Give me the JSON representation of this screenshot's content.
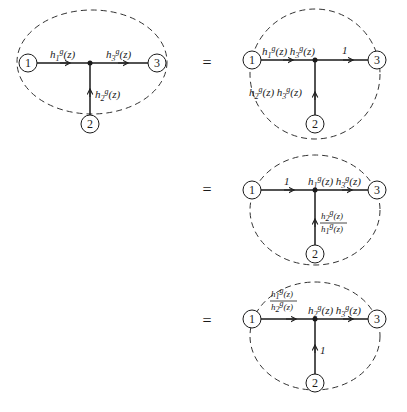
{
  "equals_sign": "=",
  "diagrams": [
    {
      "id": "original",
      "nodes": [
        "1",
        "2",
        "3"
      ],
      "edges": {
        "e1_to_junction": "h₁ᵍ(z)",
        "junction_to_e3": "h₃ᵍ(z)",
        "e2_to_junction": "h₂ᵍ(z)"
      }
    },
    {
      "id": "equivalent-a",
      "nodes": [
        "1",
        "2",
        "3"
      ],
      "edges": {
        "e1_to_junction": "h₁ᵍ(z) h₃ᵍ(z)",
        "junction_to_e3": "1",
        "e2_to_junction": "h₂ᵍ(z) h₃ᵍ(z)"
      }
    },
    {
      "id": "equivalent-b",
      "nodes": [
        "1",
        "2",
        "3"
      ],
      "edges": {
        "e1_to_junction": "1",
        "junction_to_e3": "h₁ᵍ(z) h₃ᵍ(z)",
        "e2_to_junction_num": "h₂ᵍ(z)",
        "e2_to_junction_den": "h₁ᵍ(z)"
      }
    },
    {
      "id": "equivalent-c",
      "nodes": [
        "1",
        "2",
        "3"
      ],
      "edges": {
        "e1_to_junction_num": "h₁ᵍ(z)",
        "e1_to_junction_den": "h₂ᵍ(z)",
        "junction_to_e3": "h₂ᵍ(z) h₃ᵍ(z)",
        "e2_to_junction": "1"
      }
    }
  ]
}
